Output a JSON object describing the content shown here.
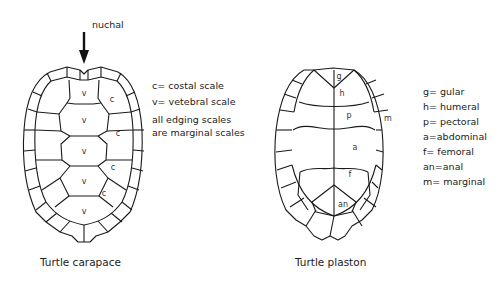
{
  "carapace": {
    "caption": "Turtle carapace",
    "pointer_label": "nuchal",
    "scute_labels": {
      "vertebral": "v",
      "costal": "c"
    },
    "legend": [
      "c= costal scale",
      "v= vetebral scale"
    ],
    "note": [
      "all edging scales",
      "are marginal scales"
    ]
  },
  "plastron": {
    "caption": "Turtle plaston",
    "scute_labels": {
      "gular": "g",
      "humeral": "h",
      "pectoral": "p",
      "abdominal": "a",
      "femoral": "f",
      "anal": "an",
      "marginal": "m"
    },
    "legend": [
      "g= gular",
      "h= humeral",
      "p= pectoral",
      "a=abdominal",
      "f= femoral",
      "an=anal",
      "m= marginal"
    ]
  }
}
